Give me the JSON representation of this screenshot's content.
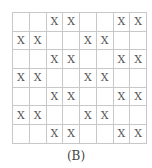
{
  "figure": {
    "label": "(B)",
    "rows": 7,
    "cols": 8,
    "grid": [
      [
        "",
        "",
        "X",
        "X",
        "",
        "",
        "X",
        "X"
      ],
      [
        "X",
        "X",
        "",
        "",
        "X",
        "X",
        "",
        ""
      ],
      [
        "",
        "",
        "X",
        "X",
        "",
        "",
        "X",
        "X"
      ],
      [
        "X",
        "X",
        "",
        "",
        "X",
        "X",
        "",
        ""
      ],
      [
        "",
        "",
        "X",
        "X",
        "",
        "",
        "X",
        "X"
      ],
      [
        "X",
        "X",
        "",
        "",
        "X",
        "X",
        "",
        ""
      ],
      [
        "",
        "",
        "X",
        "X",
        "",
        "",
        "X",
        "X"
      ]
    ]
  }
}
